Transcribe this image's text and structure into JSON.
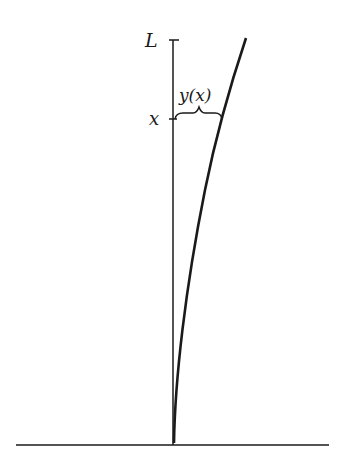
{
  "diagram": {
    "type": "beam-deflection",
    "labels": {
      "top": "L",
      "position": "x",
      "deflection": "y(x)"
    },
    "colors": {
      "stroke": "#1a1a1a",
      "background": "#ffffff"
    }
  }
}
